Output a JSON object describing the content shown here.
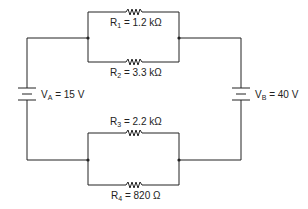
{
  "diagram": {
    "type": "circuit",
    "sources": [
      {
        "id": "VA",
        "symbol": "V",
        "sub": "A",
        "value": "= 15 V"
      },
      {
        "id": "VB",
        "symbol": "V",
        "sub": "B",
        "value": "= 40 V"
      }
    ],
    "resistors": [
      {
        "id": "R1",
        "symbol": "R",
        "sub": "1",
        "value": "= 1.2 kΩ"
      },
      {
        "id": "R2",
        "symbol": "R",
        "sub": "2",
        "value": "= 3.3 kΩ"
      },
      {
        "id": "R3",
        "symbol": "R",
        "sub": "3",
        "value": "= 2.2 kΩ"
      },
      {
        "id": "R4",
        "symbol": "R",
        "sub": "4",
        "value": "= 820 Ω"
      }
    ],
    "colors": {
      "line": "#222222",
      "background": "#ffffff"
    }
  }
}
